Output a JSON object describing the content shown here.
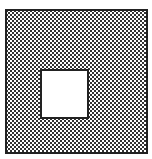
{
  "diagram": {
    "outer_square": {
      "fill": "stippled",
      "border_color": "#222222"
    },
    "inner_square": {
      "fill": "#ffffff",
      "border_color": "#222222"
    }
  }
}
